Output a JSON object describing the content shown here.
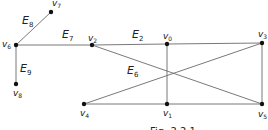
{
  "figure": {
    "caption": "Fig. 2.2.1",
    "nodes": [
      {
        "id": "v0",
        "label": "v",
        "sub": "0",
        "x": 167,
        "y": 44,
        "lx": 163,
        "ly": 39
      },
      {
        "id": "v1",
        "label": "v",
        "sub": "1",
        "x": 167,
        "y": 104,
        "lx": 163,
        "ly": 116
      },
      {
        "id": "v2",
        "label": "v",
        "sub": "2",
        "x": 92,
        "y": 45,
        "lx": 88,
        "ly": 41
      },
      {
        "id": "v3",
        "label": "v",
        "sub": "3",
        "x": 262,
        "y": 43,
        "lx": 258,
        "ly": 37
      },
      {
        "id": "v4",
        "label": "v",
        "sub": "4",
        "x": 84,
        "y": 104,
        "lx": 80,
        "ly": 116
      },
      {
        "id": "v5",
        "label": "v",
        "sub": "5",
        "x": 262,
        "y": 104,
        "lx": 258,
        "ly": 117
      },
      {
        "id": "v6",
        "label": "v",
        "sub": "6",
        "x": 16,
        "y": 45,
        "lx": 2,
        "ly": 47
      },
      {
        "id": "v7",
        "label": "v",
        "sub": "7",
        "x": 51,
        "y": 12,
        "lx": 52,
        "ly": 6
      },
      {
        "id": "v8",
        "label": "v",
        "sub": "8",
        "x": 16,
        "y": 84,
        "lx": 13,
        "ly": 96
      }
    ],
    "edges": [
      {
        "from": "v6",
        "to": "v7",
        "label": "E",
        "sub": "8",
        "lx": 22,
        "ly": 24
      },
      {
        "from": "v6",
        "to": "v8",
        "label": "E",
        "sub": "9",
        "lx": 20,
        "ly": 72
      },
      {
        "from": "v6",
        "to": "v2",
        "label": "E",
        "sub": "7",
        "lx": 62,
        "ly": 38
      },
      {
        "from": "v2",
        "to": "v0",
        "label": "E",
        "sub": "2",
        "lx": 132,
        "ly": 38
      },
      {
        "from": "v2",
        "to": "v5",
        "label": "E",
        "sub": "6",
        "lx": 127,
        "ly": 74
      },
      {
        "from": "v0",
        "to": "v3",
        "label": "",
        "sub": ""
      },
      {
        "from": "v0",
        "to": "v1",
        "label": "",
        "sub": ""
      },
      {
        "from": "v3",
        "to": "v5",
        "label": "",
        "sub": ""
      },
      {
        "from": "v4",
        "to": "v1",
        "label": "",
        "sub": ""
      },
      {
        "from": "v1",
        "to": "v5",
        "label": "",
        "sub": ""
      },
      {
        "from": "v4",
        "to": "v3",
        "label": "",
        "sub": ""
      }
    ]
  }
}
